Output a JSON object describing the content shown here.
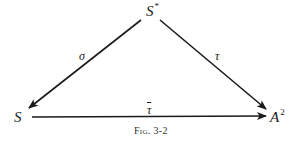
{
  "diagram": {
    "type": "commutative-diagram",
    "nodes": [
      {
        "id": "S_star",
        "base": "S",
        "sup": "*"
      },
      {
        "id": "S",
        "base": "S",
        "sup": ""
      },
      {
        "id": "A2",
        "base": "A",
        "sup": "2"
      }
    ],
    "edges": [
      {
        "from": "S_star",
        "to": "S",
        "label": "σ"
      },
      {
        "from": "S_star",
        "to": "A2",
        "label": "τ"
      },
      {
        "from": "S",
        "to": "A2",
        "label": "τ"
      }
    ],
    "caption": {
      "prefix": "Fig.",
      "number": "3-2"
    }
  }
}
